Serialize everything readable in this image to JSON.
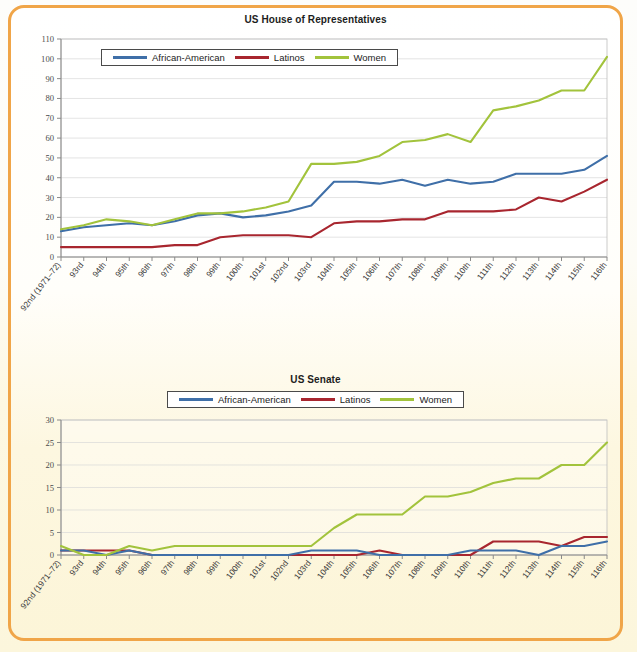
{
  "page": {
    "border_color": "#f0a548",
    "background_top": "#ffffff",
    "background_bottom": "#fcf5d8"
  },
  "legend_common": {
    "items": [
      {
        "label": "African-American",
        "color": "#3f6fa8"
      },
      {
        "label": "Latinos",
        "color": "#a8262f"
      },
      {
        "label": "Women",
        "color": "#a2c33c"
      }
    ]
  },
  "chart_data": [
    {
      "type": "line",
      "title": "US House of Representatives",
      "xlabel": "",
      "ylabel": "",
      "ylim": [
        0,
        110
      ],
      "ytick_step": 10,
      "yticks": [
        0,
        10,
        20,
        30,
        40,
        50,
        60,
        70,
        80,
        90,
        100,
        110
      ],
      "grid": true,
      "legend_position": "top-left-inside",
      "categories": [
        "92nd (1971–72)",
        "93rd",
        "94th",
        "95th",
        "96th",
        "97th",
        "98th",
        "99th",
        "100th",
        "101st",
        "102nd",
        "103rd",
        "104th",
        "105th",
        "106th",
        "107th",
        "108th",
        "109th",
        "110th",
        "111th",
        "112th",
        "113th",
        "114th",
        "115th",
        "116th"
      ],
      "series": [
        {
          "name": "African-American",
          "color": "#3f6fa8",
          "values": [
            13,
            15,
            16,
            17,
            16,
            18,
            21,
            22,
            20,
            21,
            23,
            26,
            38,
            38,
            37,
            39,
            36,
            39,
            37,
            38,
            42,
            42,
            42,
            44,
            51
          ]
        },
        {
          "name": "Latinos",
          "color": "#a8262f",
          "values": [
            5,
            5,
            5,
            5,
            5,
            6,
            6,
            10,
            11,
            11,
            11,
            10,
            17,
            18,
            18,
            19,
            19,
            23,
            23,
            23,
            24,
            30,
            28,
            33,
            39
          ]
        },
        {
          "name": "Women",
          "color": "#a2c33c",
          "values": [
            14,
            16,
            19,
            18,
            16,
            19,
            22,
            22,
            23,
            25,
            28,
            47,
            47,
            48,
            51,
            58,
            59,
            62,
            58,
            74,
            76,
            79,
            84,
            84,
            101
          ]
        }
      ]
    },
    {
      "type": "line",
      "title": "US Senate",
      "xlabel": "",
      "ylabel": "",
      "ylim": [
        0,
        30
      ],
      "ytick_step": 5,
      "yticks": [
        0,
        5,
        10,
        15,
        20,
        25,
        30
      ],
      "grid": true,
      "legend_position": "top-center-above",
      "categories": [
        "92nd (1971–72)",
        "93rd",
        "94th",
        "95th",
        "96th",
        "97th",
        "98th",
        "99th",
        "100th",
        "101st",
        "102nd",
        "103rd",
        "104th",
        "105th",
        "106th",
        "107th",
        "108th",
        "109th",
        "110th",
        "111th",
        "112th",
        "113th",
        "114th",
        "115th",
        "116th"
      ],
      "series": [
        {
          "name": "African-American",
          "color": "#3f6fa8",
          "values": [
            1,
            1,
            0,
            1,
            0,
            0,
            0,
            0,
            0,
            0,
            0,
            1,
            1,
            1,
            0,
            0,
            0,
            0,
            1,
            1,
            1,
            0,
            2,
            2,
            3
          ]
        },
        {
          "name": "Latinos",
          "color": "#a8262f",
          "values": [
            1,
            1,
            1,
            1,
            0,
            0,
            0,
            0,
            0,
            0,
            0,
            0,
            0,
            0,
            1,
            0,
            0,
            0,
            0,
            3,
            3,
            3,
            2,
            4,
            4
          ]
        },
        {
          "name": "Women",
          "color": "#a2c33c",
          "values": [
            2,
            0,
            0,
            2,
            1,
            2,
            2,
            2,
            2,
            2,
            2,
            2,
            6,
            9,
            9,
            9,
            13,
            13,
            14,
            16,
            17,
            17,
            20,
            20,
            25
          ]
        }
      ]
    }
  ]
}
